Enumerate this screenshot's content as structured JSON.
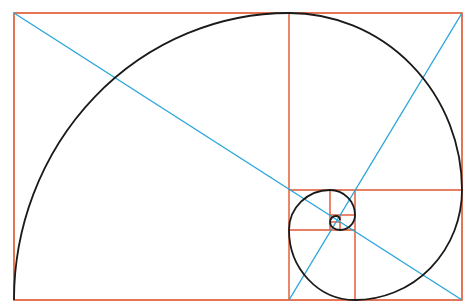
{
  "diagram": {
    "colors": {
      "rectangles": "#e0532e",
      "diagonals": "#2aa6d9",
      "spiral": "#1a1a1a",
      "background": "#ffffff"
    },
    "outer_rect": {
      "x": 14,
      "y": 13,
      "w": 448,
      "h": 287
    },
    "rectangle_lines": [
      {
        "x1": 289,
        "y1": 13,
        "x2": 289,
        "y2": 300
      },
      {
        "x1": 289,
        "y1": 190,
        "x2": 462,
        "y2": 190
      },
      {
        "x1": 355,
        "y1": 190,
        "x2": 355,
        "y2": 300
      },
      {
        "x1": 289,
        "y1": 230,
        "x2": 355,
        "y2": 230
      },
      {
        "x1": 330,
        "y1": 190,
        "x2": 330,
        "y2": 230
      },
      {
        "x1": 330,
        "y1": 215,
        "x2": 355,
        "y2": 215
      },
      {
        "x1": 340,
        "y1": 215,
        "x2": 340,
        "y2": 230
      },
      {
        "x1": 330,
        "y1": 222,
        "x2": 340,
        "y2": 222
      }
    ],
    "diagonals": [
      {
        "x1": 14,
        "y1": 13,
        "x2": 462,
        "y2": 300
      },
      {
        "x1": 462,
        "y1": 13,
        "x2": 289,
        "y2": 300
      }
    ]
  }
}
